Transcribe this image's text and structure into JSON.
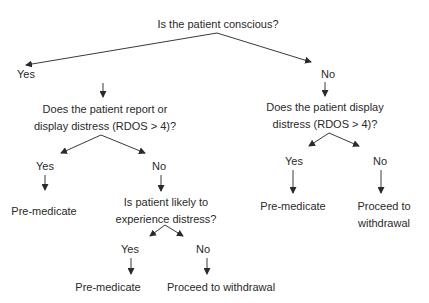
{
  "diagram": {
    "type": "decision-tree",
    "root": "Is the patient conscious?",
    "yes_branch": {
      "label": "Yes",
      "question_line1": "Does the patient report or",
      "question_line2": "display distress (RDOS > 4)?",
      "yes": {
        "label": "Yes",
        "outcome": "Pre-medicate"
      },
      "no": {
        "label": "No",
        "question_line1": "Is patient likely to",
        "question_line2": "experience distress?",
        "yes": {
          "label": "Yes",
          "outcome": "Pre-medicate"
        },
        "no": {
          "label": "No",
          "outcome": "Proceed to withdrawal"
        }
      }
    },
    "no_branch": {
      "label": "No",
      "question_line1": "Does the patient display",
      "question_line2": "distress (RDOS > 4)?",
      "yes": {
        "label": "Yes",
        "outcome": "Pre-medicate"
      },
      "no": {
        "label": "No",
        "outcome_line1": "Proceed to",
        "outcome_line2": "withdrawal"
      }
    },
    "line_color": "#3a3a3a"
  }
}
